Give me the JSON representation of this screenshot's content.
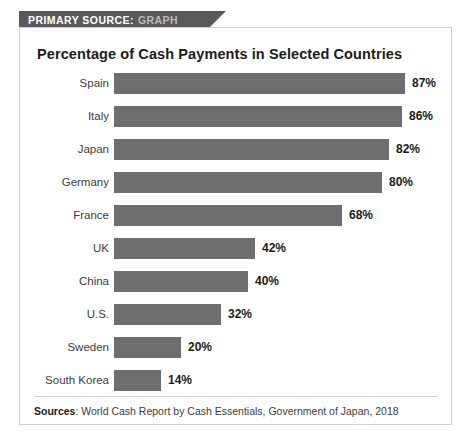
{
  "banner": {
    "label_strong": "PRIMARY SOURCE:",
    "label_light": "GRAPH",
    "background_color": "#59595b"
  },
  "chart_data": {
    "type": "bar",
    "orientation": "horizontal",
    "title": "Percentage of Cash Payments in Selected Countries",
    "xlabel": "",
    "ylabel": "",
    "xlim": [
      0,
      100
    ],
    "grid": false,
    "legend": null,
    "bar_color": "#6e6e70",
    "value_suffix": "%",
    "categories": [
      "Spain",
      "Italy",
      "Japan",
      "Germany",
      "France",
      "UK",
      "China",
      "U.S.",
      "Sweden",
      "South Korea"
    ],
    "values": [
      87,
      86,
      82,
      80,
      68,
      42,
      40,
      32,
      20,
      14
    ],
    "data_labels": [
      "87%",
      "86%",
      "82%",
      "80%",
      "68%",
      "42%",
      "40%",
      "32%",
      "20%",
      "14%"
    ],
    "rows": [
      {
        "label": "Spain",
        "value": 87,
        "value_label": "87%"
      },
      {
        "label": "Italy",
        "value": 86,
        "value_label": "86%"
      },
      {
        "label": "Japan",
        "value": 82,
        "value_label": "82%"
      },
      {
        "label": "Germany",
        "value": 80,
        "value_label": "80%"
      },
      {
        "label": "France",
        "value": 68,
        "value_label": "68%"
      },
      {
        "label": "UK",
        "value": 42,
        "value_label": "42%"
      },
      {
        "label": "China",
        "value": 40,
        "value_label": "40%"
      },
      {
        "label": "U.S.",
        "value": 32,
        "value_label": "32%"
      },
      {
        "label": "Sweden",
        "value": 20,
        "value_label": "20%"
      },
      {
        "label": "South Korea",
        "value": 14,
        "value_label": "14%"
      }
    ]
  },
  "footer": {
    "label": "Sources",
    "separator": ": ",
    "text": "World Cash Report by Cash Essentials, Government of Japan, 2018"
  }
}
